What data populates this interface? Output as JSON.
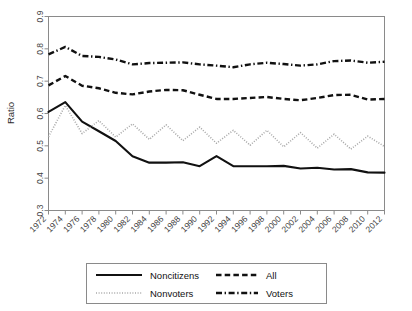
{
  "chart_data": {
    "type": "line",
    "title": "",
    "xlabel": "",
    "ylabel": "Ratio",
    "xlim": [
      1972,
      2012
    ],
    "ylim": [
      0.3,
      0.9
    ],
    "grid": false,
    "legend_position": "bottom",
    "x": [
      1972,
      1974,
      1976,
      1978,
      1980,
      1982,
      1984,
      1986,
      1988,
      1990,
      1992,
      1994,
      1996,
      1998,
      2000,
      2002,
      2004,
      2006,
      2008,
      2010,
      2012
    ],
    "xtick_labels": [
      "1972",
      "1974",
      "1976",
      "1978",
      "1980",
      "1982",
      "1984",
      "1986",
      "1988",
      "1990",
      "1992",
      "1994",
      "1996",
      "1998",
      "2000",
      "2002",
      "2004",
      "2006",
      "2008",
      "2010",
      "2012"
    ],
    "ytick_labels": [
      "0.3",
      "0.4",
      "0.5",
      "0.6",
      "0.7",
      "0.8",
      "0.9"
    ],
    "ytick_values": [
      0.3,
      0.4,
      0.5,
      0.6,
      0.7,
      0.8,
      0.9
    ],
    "series": [
      {
        "name": "Noncitizens",
        "style": "solid",
        "color": "#111111",
        "values": [
          0.605,
          0.635,
          0.575,
          0.545,
          0.515,
          0.468,
          0.448,
          0.448,
          0.449,
          0.437,
          0.468,
          0.437,
          0.437,
          0.437,
          0.438,
          0.43,
          0.432,
          0.427,
          0.428,
          0.418,
          0.417
        ]
      },
      {
        "name": "Nonvoters",
        "style": "dotted",
        "color": "#a8a8a8",
        "values": [
          0.528,
          0.625,
          0.538,
          0.578,
          0.527,
          0.568,
          0.52,
          0.565,
          0.516,
          0.558,
          0.508,
          0.548,
          0.502,
          0.548,
          0.497,
          0.541,
          0.493,
          0.536,
          0.49,
          0.53,
          0.498
        ]
      },
      {
        "name": "All",
        "style": "dashed",
        "color": "#111111",
        "values": [
          0.687,
          0.716,
          0.686,
          0.678,
          0.664,
          0.659,
          0.668,
          0.673,
          0.672,
          0.658,
          0.645,
          0.645,
          0.648,
          0.651,
          0.645,
          0.641,
          0.648,
          0.657,
          0.658,
          0.643,
          0.645
        ]
      },
      {
        "name": "Voters",
        "style": "dashdot",
        "color": "#111111",
        "values": [
          0.783,
          0.806,
          0.778,
          0.775,
          0.767,
          0.752,
          0.756,
          0.757,
          0.758,
          0.752,
          0.748,
          0.743,
          0.752,
          0.757,
          0.753,
          0.748,
          0.752,
          0.762,
          0.764,
          0.757,
          0.76
        ]
      }
    ]
  },
  "legend": {
    "entries": [
      {
        "label": "Noncitizens",
        "style": "solid"
      },
      {
        "label": "All",
        "style": "dashed"
      },
      {
        "label": "Nonvoters",
        "style": "dotted"
      },
      {
        "label": "Voters",
        "style": "dashdot"
      }
    ]
  }
}
